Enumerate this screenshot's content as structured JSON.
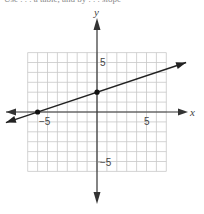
{
  "caption": "Use . . . a table, and by . . . slope",
  "chart_data": {
    "type": "line",
    "title": "",
    "xlabel": "x",
    "ylabel": "y",
    "xlim": [
      -7,
      7
    ],
    "ylim": [
      -6,
      6
    ],
    "grid": true,
    "x_tick_labels": [
      {
        "value": -5,
        "label": "−5"
      },
      {
        "value": 5,
        "label": "5"
      }
    ],
    "y_tick_labels": [
      {
        "value": 5,
        "label": "5"
      },
      {
        "value": -5,
        "label": "−5"
      }
    ],
    "series": [
      {
        "name": "line",
        "equation": "y = (1/3)x + 2",
        "slope": 0.3333,
        "intercept": 2,
        "points": [
          {
            "x": -6,
            "y": 0
          },
          {
            "x": 0,
            "y": 2
          }
        ],
        "arrows_both_ends": true
      }
    ]
  },
  "labels": {
    "x_axis": "x",
    "y_axis": "y",
    "x_neg5": "−5",
    "x_pos5": "5",
    "y_pos5": "5",
    "y_neg5": "−5"
  }
}
